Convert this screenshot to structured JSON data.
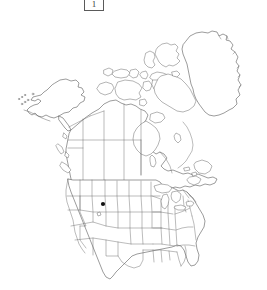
{
  "figure": {
    "legend_label": "1",
    "legend_box_name": "figure-number-box"
  },
  "map": {
    "title": "North America outline distribution map",
    "projection_note": "Conic, North America",
    "background_color": "#ffffff",
    "coastline_color": "#4a4a4a",
    "boundary_color": "#6a6a6a",
    "marker_color": "#111111",
    "regions": [
      "Alaska",
      "Canada",
      "Greenland",
      "Contiguous United States",
      "Arctic Archipelago",
      "Aleutian Islands"
    ],
    "occurrence_count": "1",
    "occurrences": [
      {
        "label": "Idaho",
        "x": 103,
        "y": 204,
        "radius": 2.1
      }
    ]
  },
  "chart_data": {
    "type": "map",
    "map_extent": "North America including Alaska, Canada, Greenland and the contiguous United States",
    "point_count": 1,
    "points": [
      {
        "region": "Idaho",
        "px_x": 103,
        "px_y": 204
      }
    ],
    "legend": [
      "1"
    ]
  }
}
